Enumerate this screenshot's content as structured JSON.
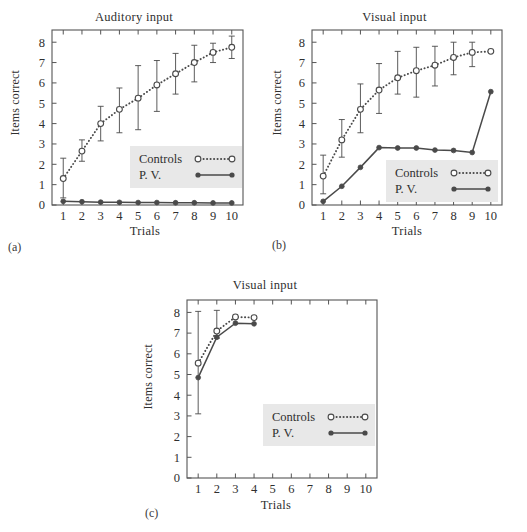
{
  "figure": {
    "panels": [
      {
        "id": "a",
        "panel_label": "(a)",
        "title": "Auditory input",
        "xlabel": "Trials",
        "ylabel": "Items correct",
        "legend": {
          "controls": "Controls",
          "pv": "P. V."
        }
      },
      {
        "id": "b",
        "panel_label": "(b)",
        "title": "Visual input",
        "xlabel": "Trials",
        "ylabel": "Items correct",
        "legend": {
          "controls": "Controls",
          "pv": "P. V."
        }
      },
      {
        "id": "c",
        "panel_label": "(c)",
        "title": "Visual input",
        "xlabel": "Trials",
        "ylabel": "Items correct",
        "legend": {
          "controls": "Controls",
          "pv": "P. V."
        }
      }
    ],
    "colors": {
      "line": "#4a4a4a",
      "axis": "#555555",
      "text": "#2f2f2f",
      "legend_background": "#e8e8e8"
    }
  },
  "chart_data": [
    {
      "type": "line",
      "panel": "a",
      "title": "Auditory input",
      "xlabel": "Trials",
      "ylabel": "Items correct",
      "xlim": [
        0.4,
        10.6
      ],
      "ylim": [
        0,
        8.6
      ],
      "xticks": [
        1,
        2,
        3,
        4,
        5,
        6,
        7,
        8,
        9,
        10
      ],
      "xticklabels": [
        "1",
        "2",
        "3",
        "4",
        "5",
        "6",
        "7",
        "8",
        "9",
        "10"
      ],
      "yticks": [
        0,
        1,
        2,
        3,
        4,
        5,
        6,
        7,
        8
      ],
      "yticklabels": [
        "0",
        "1",
        "2",
        "3",
        "4",
        "5",
        "6",
        "7",
        "8"
      ],
      "grid": false,
      "legend_position": "center-right",
      "x": [
        1,
        2,
        3,
        4,
        5,
        6,
        7,
        8,
        9,
        10
      ],
      "series": [
        {
          "name": "Controls",
          "style": "dotted",
          "marker": "open-circle",
          "values": [
            1.3,
            2.65,
            4.0,
            4.7,
            5.25,
            5.9,
            6.45,
            7.0,
            7.5,
            7.75
          ],
          "error_low": [
            0.35,
            2.15,
            3.15,
            3.55,
            3.7,
            4.6,
            5.45,
            6.05,
            7.0,
            7.2
          ],
          "error_high": [
            2.3,
            3.2,
            4.85,
            5.75,
            6.85,
            7.1,
            7.45,
            7.85,
            7.95,
            8.3
          ]
        },
        {
          "name": "P. V.",
          "style": "solid",
          "marker": "filled-circle",
          "values": [
            0.18,
            0.16,
            0.14,
            0.13,
            0.12,
            0.12,
            0.11,
            0.11,
            0.1,
            0.1
          ]
        }
      ]
    },
    {
      "type": "line",
      "panel": "b",
      "title": "Visual input",
      "xlabel": "Trials",
      "ylabel": "Items correct",
      "xlim": [
        0.4,
        10.6
      ],
      "ylim": [
        0,
        8.6
      ],
      "xticks": [
        1,
        2,
        3,
        4,
        5,
        6,
        7,
        8,
        9,
        10
      ],
      "xticklabels": [
        "1",
        "2",
        "3",
        "4",
        "5",
        "6",
        "7",
        "8",
        "9",
        "10"
      ],
      "yticks": [
        0,
        1,
        2,
        3,
        4,
        5,
        6,
        7,
        8
      ],
      "yticklabels": [
        "0",
        "1",
        "2",
        "3",
        "4",
        "5",
        "6",
        "7",
        "8"
      ],
      "grid": false,
      "legend_position": "lower-right",
      "x": [
        1,
        2,
        3,
        4,
        5,
        6,
        7,
        8,
        9,
        10
      ],
      "series": [
        {
          "name": "Controls",
          "style": "dotted",
          "marker": "open-circle",
          "values": [
            1.42,
            3.2,
            4.7,
            5.65,
            6.25,
            6.6,
            6.87,
            7.25,
            7.5,
            7.55
          ],
          "error_low": [
            0.55,
            2.35,
            3.55,
            4.5,
            5.45,
            5.3,
            5.85,
            6.4,
            6.8,
            7.55
          ],
          "error_high": [
            2.45,
            4.2,
            5.95,
            6.95,
            7.55,
            7.75,
            7.8,
            8.0,
            8.0,
            7.55
          ]
        },
        {
          "name": "P. V.",
          "style": "solid",
          "marker": "filled-circle",
          "values": [
            0.18,
            0.92,
            1.85,
            2.82,
            2.8,
            2.8,
            2.7,
            2.68,
            2.58,
            5.57
          ]
        }
      ]
    },
    {
      "type": "line",
      "panel": "c",
      "title": "Visual input",
      "xlabel": "Trials",
      "ylabel": "Items correct",
      "xlim": [
        0.4,
        10.6
      ],
      "ylim": [
        0,
        8.6
      ],
      "xticks": [
        1,
        2,
        3,
        4,
        5,
        6,
        7,
        8,
        9,
        10
      ],
      "xticklabels": [
        "1",
        "2",
        "3",
        "4",
        "5",
        "6",
        "7",
        "8",
        "9",
        "10"
      ],
      "yticks": [
        0,
        1,
        2,
        3,
        4,
        5,
        6,
        7,
        8
      ],
      "yticklabels": [
        "0",
        "1",
        "2",
        "3",
        "4",
        "5",
        "6",
        "7",
        "8"
      ],
      "grid": false,
      "legend_position": "center-right",
      "x": [
        1,
        2,
        3,
        4
      ],
      "series": [
        {
          "name": "Controls",
          "style": "dotted",
          "marker": "open-circle",
          "values": [
            5.55,
            7.1,
            7.78,
            7.75
          ],
          "error_low": [
            3.1,
            6.75,
            7.78,
            7.75
          ],
          "error_high": [
            8.05,
            8.1,
            7.78,
            7.75
          ]
        },
        {
          "name": "P. V.",
          "style": "solid",
          "marker": "filled-circle",
          "values": [
            4.85,
            6.8,
            7.48,
            7.45
          ]
        }
      ]
    }
  ]
}
